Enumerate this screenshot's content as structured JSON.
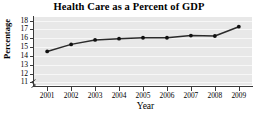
{
  "chart_data": {
    "type": "line",
    "title": "Health Care as a Percent of GDP",
    "xlabel": "Year",
    "ylabel": "Percentage",
    "categories": [
      "2001",
      "2002",
      "2003",
      "2004",
      "2005",
      "2006",
      "2007",
      "2008",
      "2009"
    ],
    "values": [
      14.5,
      15.3,
      15.8,
      15.95,
      16.05,
      16.05,
      16.3,
      16.25,
      17.3
    ],
    "x": [
      2001,
      2002,
      2003,
      2004,
      2005,
      2006,
      2007,
      2008,
      2009
    ],
    "ylim": [
      10.7,
      18.4
    ],
    "xlim": [
      2000.45,
      2009.55
    ],
    "yticks": [
      11,
      12,
      13,
      14,
      15,
      16,
      17,
      18
    ],
    "ytick_labels": [
      "11",
      "12",
      "13",
      "14",
      "15",
      "16",
      "17",
      "18"
    ],
    "xtick_labels": [
      "2001",
      "2002",
      "2003",
      "2004",
      "2005",
      "2006",
      "2007",
      "2008",
      "2009"
    ],
    "grid": true,
    "grid_axis": "y",
    "legend": false,
    "legend_position": "none",
    "axis_break": true,
    "marker": "filled-circle",
    "series": [
      {
        "name": "Health care percent of GDP",
        "values": [
          14.5,
          15.3,
          15.8,
          15.95,
          16.05,
          16.05,
          16.3,
          16.25,
          17.3
        ]
      }
    ],
    "colors": {
      "line": "#2b2b2b",
      "marker": "#111111",
      "plot_background": "#e8e8e8",
      "gridline": "#f7f7f7",
      "axis": "#3a3a3a",
      "text": "#000000",
      "figure_background": "#ffffff"
    }
  }
}
